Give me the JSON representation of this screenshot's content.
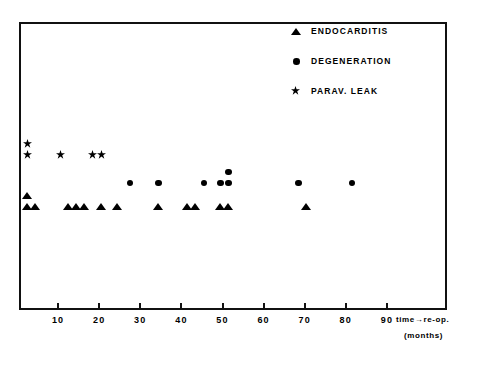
{
  "figure": {
    "caption": ""
  },
  "legend": {
    "position": "top-right",
    "entries": [
      {
        "marker": "triangle-icon",
        "label": "ENDOCARDITIS"
      },
      {
        "marker": "circle-icon",
        "label": "DEGENERATION"
      },
      {
        "marker": "star-icon",
        "label": "PARAV. LEAK"
      }
    ]
  },
  "axis": {
    "title": "time→re-op.",
    "units": "(months)",
    "ticks": [
      10,
      20,
      30,
      40,
      50,
      60,
      70,
      80,
      90
    ],
    "tick_labels": [
      "10",
      "20",
      "30",
      "40",
      "50",
      "60",
      "70",
      "80",
      "90"
    ],
    "xlim": [
      0,
      104
    ]
  },
  "chart_data": {
    "type": "scatter",
    "title": "",
    "xlabel": "time→re-op. (months)",
    "ylabel": "",
    "xlim": [
      0,
      104
    ],
    "grid": false,
    "legend_position": "top-right",
    "note": "Dot-plot: each series occupies its own horizontal band; stacked markers indicate multiple cases at the same month.",
    "series": [
      {
        "name": "PARAV. LEAK",
        "marker": "star",
        "band_y_px": 152,
        "points": [
          {
            "x": 2,
            "stack": 0
          },
          {
            "x": 2,
            "stack": 1
          },
          {
            "x": 10,
            "stack": 0
          },
          {
            "x": 18,
            "stack": 0
          },
          {
            "x": 20,
            "stack": 0
          }
        ],
        "values": [
          2,
          2,
          10,
          18,
          20
        ],
        "count": 5
      },
      {
        "name": "DEGENERATION",
        "marker": "circle",
        "band_y_px": 181,
        "points": [
          {
            "x": 27,
            "stack": 0
          },
          {
            "x": 34,
            "stack": 0
          },
          {
            "x": 45,
            "stack": 0
          },
          {
            "x": 49,
            "stack": 0
          },
          {
            "x": 51,
            "stack": 0
          },
          {
            "x": 51,
            "stack": 1
          },
          {
            "x": 68,
            "stack": 0
          },
          {
            "x": 81,
            "stack": 0
          }
        ],
        "values": [
          27,
          34,
          45,
          49,
          51,
          51,
          68,
          81
        ],
        "count": 8
      },
      {
        "name": "ENDOCARDITIS",
        "marker": "triangle",
        "band_y_px": 204,
        "points": [
          {
            "x": 2,
            "stack": 0
          },
          {
            "x": 2,
            "stack": 1
          },
          {
            "x": 4,
            "stack": 0
          },
          {
            "x": 12,
            "stack": 0
          },
          {
            "x": 14,
            "stack": 0
          },
          {
            "x": 16,
            "stack": 0
          },
          {
            "x": 20,
            "stack": 0
          },
          {
            "x": 24,
            "stack": 0
          },
          {
            "x": 34,
            "stack": 0
          },
          {
            "x": 41,
            "stack": 0
          },
          {
            "x": 43,
            "stack": 0
          },
          {
            "x": 49,
            "stack": 0
          },
          {
            "x": 51,
            "stack": 0
          },
          {
            "x": 70,
            "stack": 0
          }
        ],
        "values": [
          2,
          2,
          4,
          12,
          14,
          16,
          20,
          24,
          34,
          41,
          43,
          49,
          51,
          70
        ],
        "count": 14
      }
    ]
  }
}
